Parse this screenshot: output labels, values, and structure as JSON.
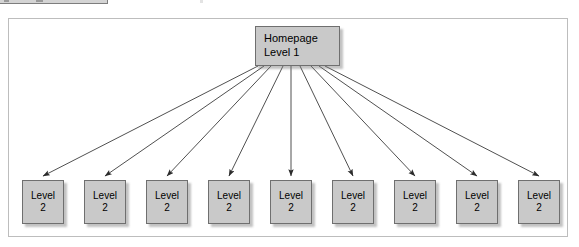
{
  "toolbar": {
    "name": "cut-off-toolbar-strip",
    "visible_label": ""
  },
  "diagram": {
    "type": "site-map-tree",
    "root": {
      "line1": "Homepage",
      "line2": "Level 1"
    },
    "children": [
      {
        "line1": "Level",
        "line2": "2"
      },
      {
        "line1": "Level",
        "line2": "2"
      },
      {
        "line1": "Level",
        "line2": "2"
      },
      {
        "line1": "Level",
        "line2": "2"
      },
      {
        "line1": "Level",
        "line2": "2"
      },
      {
        "line1": "Level",
        "line2": "2"
      },
      {
        "line1": "Level",
        "line2": "2"
      },
      {
        "line1": "Level",
        "line2": "2"
      },
      {
        "line1": "Level",
        "line2": "2"
      }
    ],
    "child_count": 9,
    "colors": {
      "node_fill": "#c9c9c9",
      "node_border": "#6f6f6f",
      "container_border": "#bdbdbd",
      "canvas_background": "#ffffff",
      "connector": "#3c3c3c",
      "toolbar_fill": "#d4d4d4"
    },
    "layout": {
      "root_x": 255,
      "root_y": 26,
      "root_width": 85,
      "root_height": 40,
      "child_y": 180,
      "child_width": 42,
      "child_height": 44,
      "child_spacing": 62,
      "child_first_x": 22,
      "container": {
        "x": 8,
        "y": 18,
        "width": 560,
        "height": 219
      }
    }
  }
}
